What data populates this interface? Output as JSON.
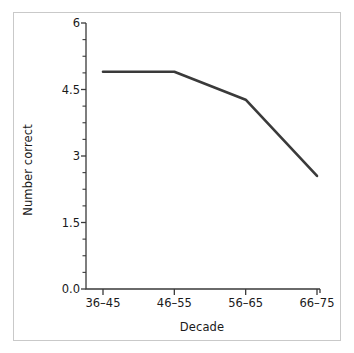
{
  "chart_data": {
    "type": "line",
    "title": "",
    "xlabel": "Decade",
    "ylabel": "Number correct",
    "categories": [
      "36–45",
      "46–55",
      "56–65",
      "66–75"
    ],
    "values": [
      4.9,
      4.9,
      4.27,
      2.55
    ],
    "series": [
      {
        "name": "Number correct",
        "values": [
          4.9,
          4.9,
          4.27,
          2.55
        ],
        "color": "#3a3a3a"
      }
    ],
    "ylim": [
      0,
      6
    ],
    "ytick_labels": [
      "6",
      "4.5",
      "3",
      "1.5",
      "0.0"
    ],
    "ytick_values": [
      6,
      4.5,
      3,
      1.5,
      0
    ],
    "yminor_tick_interval": 0.375,
    "grid": false,
    "legend": false,
    "legend_position": "none",
    "line_color": "#3a3a3a",
    "line_width": 2.6,
    "axis_color": "#3a3a3a",
    "frame_color": "#c9c9c9",
    "background_color": "#ffffff"
  }
}
